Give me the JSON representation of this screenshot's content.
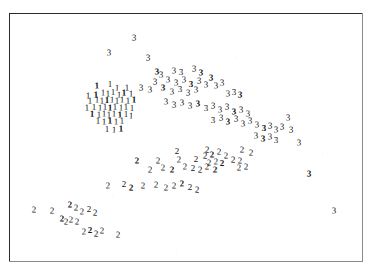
{
  "figure": {
    "background_color": "#ffffff",
    "frame": {
      "color": "#2b2b2b",
      "x": 9,
      "y": 13,
      "width": 354,
      "height": 249,
      "line_width": 1
    },
    "marker_font_size": 9,
    "marker_color": "#1a1a1a"
  },
  "chart_data": {
    "type": "scatter",
    "title": "",
    "subtitle": "",
    "xlabel": "",
    "ylabel": "",
    "xlim": [
      9,
      363
    ],
    "ylim": [
      13,
      262
    ],
    "grid": false,
    "legend": null,
    "axis_ticks": false,
    "axis_tick_labels": false,
    "note": "Points are drawn as the group-label digit glyph itself; pixel coordinates are measured in image space with y increasing downward.",
    "series": [
      {
        "name": "1",
        "label": "1",
        "color": "#131313",
        "count": 46,
        "points": [
          [
            97,
            86
          ],
          [
            110,
            84
          ],
          [
            117,
            88
          ],
          [
            127,
            88
          ],
          [
            88,
            96
          ],
          [
            96,
            95
          ],
          [
            103,
            93
          ],
          [
            108,
            94
          ],
          [
            113,
            92
          ],
          [
            119,
            95
          ],
          [
            124,
            93
          ],
          [
            131,
            94
          ],
          [
            90,
            101
          ],
          [
            97,
            100
          ],
          [
            102,
            101
          ],
          [
            107,
            100
          ],
          [
            112,
            100
          ],
          [
            117,
            101
          ],
          [
            122,
            100
          ],
          [
            128,
            101
          ],
          [
            134,
            100
          ],
          [
            87,
            108
          ],
          [
            94,
            107
          ],
          [
            100,
            108
          ],
          [
            105,
            107
          ],
          [
            110,
            108
          ],
          [
            115,
            107
          ],
          [
            121,
            108
          ],
          [
            126,
            107
          ],
          [
            132,
            108
          ],
          [
            92,
            114
          ],
          [
            99,
            115
          ],
          [
            104,
            114
          ],
          [
            109,
            115
          ],
          [
            114,
            114
          ],
          [
            120,
            115
          ],
          [
            126,
            114
          ],
          [
            131,
            116
          ],
          [
            98,
            121
          ],
          [
            104,
            122
          ],
          [
            110,
            121
          ],
          [
            116,
            122
          ],
          [
            122,
            121
          ],
          [
            107,
            129
          ],
          [
            114,
            130
          ],
          [
            121,
            129
          ]
        ]
      },
      {
        "name": "2",
        "label": "2",
        "color": "#151515",
        "count": 53,
        "points": [
          [
            177,
            151
          ],
          [
            207,
            150
          ],
          [
            242,
            150
          ],
          [
            251,
            153
          ],
          [
            137,
            161
          ],
          [
            158,
            161
          ],
          [
            179,
            160
          ],
          [
            196,
            159
          ],
          [
            205,
            156
          ],
          [
            212,
            155
          ],
          [
            219,
            152
          ],
          [
            226,
            156
          ],
          [
            209,
            163
          ],
          [
            216,
            162
          ],
          [
            222,
            163
          ],
          [
            233,
            160
          ],
          [
            240,
            161
          ],
          [
            150,
            170
          ],
          [
            163,
            168
          ],
          [
            172,
            170
          ],
          [
            185,
            167
          ],
          [
            193,
            168
          ],
          [
            200,
            170
          ],
          [
            207,
            167
          ],
          [
            215,
            170
          ],
          [
            239,
            168
          ],
          [
            246,
            167
          ],
          [
            108,
            186
          ],
          [
            124,
            184
          ],
          [
            131,
            188
          ],
          [
            143,
            186
          ],
          [
            156,
            185
          ],
          [
            166,
            188
          ],
          [
            174,
            186
          ],
          [
            182,
            184
          ],
          [
            190,
            187
          ],
          [
            197,
            190
          ],
          [
            34,
            210
          ],
          [
            52,
            211
          ],
          [
            70,
            205
          ],
          [
            76,
            208
          ],
          [
            82,
            212
          ],
          [
            89,
            209
          ],
          [
            95,
            213
          ],
          [
            62,
            219
          ],
          [
            66,
            222
          ],
          [
            71,
            220
          ],
          [
            77,
            222
          ],
          [
            84,
            232
          ],
          [
            90,
            230
          ],
          [
            96,
            234
          ],
          [
            102,
            231
          ],
          [
            118,
            235
          ]
        ]
      },
      {
        "name": "3",
        "label": "3",
        "color": "#141414",
        "count": 61,
        "points": [
          [
            134,
            38
          ],
          [
            109,
            53
          ],
          [
            148,
            58
          ],
          [
            157,
            72
          ],
          [
            161,
            75
          ],
          [
            174,
            71
          ],
          [
            181,
            72
          ],
          [
            194,
            69
          ],
          [
            201,
            73
          ],
          [
            155,
            82
          ],
          [
            168,
            80
          ],
          [
            176,
            83
          ],
          [
            184,
            80
          ],
          [
            191,
            84
          ],
          [
            199,
            81
          ],
          [
            206,
            85
          ],
          [
            141,
            88
          ],
          [
            150,
            90
          ],
          [
            163,
            88
          ],
          [
            172,
            92
          ],
          [
            180,
            89
          ],
          [
            188,
            93
          ],
          [
            196,
            90
          ],
          [
            211,
            78
          ],
          [
            216,
            86
          ],
          [
            222,
            83
          ],
          [
            228,
            94
          ],
          [
            234,
            92
          ],
          [
            240,
            95
          ],
          [
            166,
            102
          ],
          [
            174,
            105
          ],
          [
            182,
            103
          ],
          [
            190,
            106
          ],
          [
            198,
            104
          ],
          [
            206,
            108
          ],
          [
            213,
            106
          ],
          [
            220,
            110
          ],
          [
            227,
            107
          ],
          [
            234,
            112
          ],
          [
            241,
            110
          ],
          [
            248,
            114
          ],
          [
            213,
            120
          ],
          [
            221,
            118
          ],
          [
            228,
            122
          ],
          [
            236,
            119
          ],
          [
            243,
            124
          ],
          [
            250,
            121
          ],
          [
            257,
            125
          ],
          [
            264,
            128
          ],
          [
            270,
            126
          ],
          [
            276,
            130
          ],
          [
            282,
            127
          ],
          [
            256,
            136
          ],
          [
            263,
            139
          ],
          [
            270,
            137
          ],
          [
            276,
            140
          ],
          [
            291,
            130
          ],
          [
            299,
            143
          ],
          [
            309,
            174
          ],
          [
            334,
            211
          ],
          [
            288,
            118
          ]
        ]
      }
    ]
  }
}
